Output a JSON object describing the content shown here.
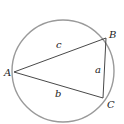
{
  "diagram": {
    "vertices": [
      {
        "label": "A",
        "x": 14,
        "y": 72
      },
      {
        "label": "B",
        "x": 106,
        "y": 38
      },
      {
        "label": "C",
        "x": 103,
        "y": 98
      }
    ],
    "sides": [
      {
        "label": "c",
        "from": "A",
        "to": "B"
      },
      {
        "label": "a",
        "from": "B",
        "to": "C"
      },
      {
        "label": "b",
        "from": "A",
        "to": "C"
      }
    ],
    "circle": {
      "cx": 63,
      "cy": 71,
      "r": 51,
      "color": "#9a9a9a"
    },
    "line_color": "#333333"
  }
}
